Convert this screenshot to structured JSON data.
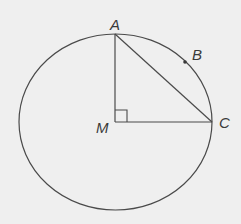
{
  "diagram": {
    "type": "geometry",
    "colors": {
      "background": "#efefef",
      "stroke": "#4a4a4a",
      "text": "#3a3a3a"
    },
    "points": {
      "A": {
        "label": "A",
        "x": 115,
        "y": 34
      },
      "B": {
        "label": "B",
        "x": 185,
        "y": 62
      },
      "C": {
        "label": "C",
        "x": 212,
        "y": 122
      },
      "M": {
        "label": "M",
        "x": 115,
        "y": 122
      }
    },
    "circle": {
      "cx": 115.5,
      "cy": 122,
      "rx": 96.5,
      "ry": 88
    },
    "segments": [
      "MA",
      "MC",
      "AC"
    ],
    "right_angle_at": "M"
  }
}
